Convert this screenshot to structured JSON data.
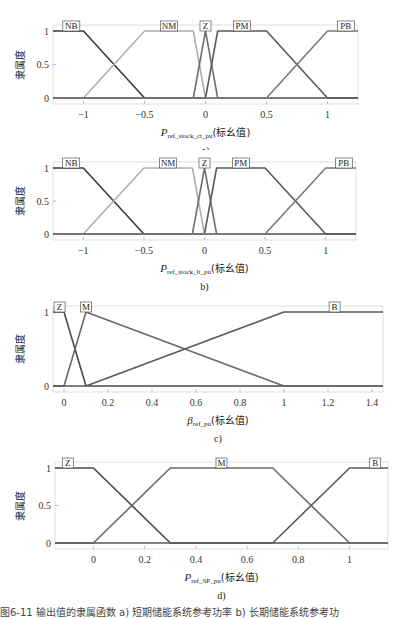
{
  "chart_data": [
    {
      "id": "a",
      "type": "line",
      "subtitle": "a)",
      "ylabel": "隶属度",
      "xlabel_var": "P",
      "xlabel_sub": "ref_stock_ct_pu",
      "xlabel_suffix": "(标幺值)",
      "xlim": [
        -1.25,
        1.25
      ],
      "ylim": [
        0,
        1
      ],
      "xticks": [
        -1,
        -0.5,
        0,
        0.5,
        1
      ],
      "xtick_labels": [
        "−1",
        "−0.5",
        "0",
        "0.5",
        "1"
      ],
      "yticks": [
        0,
        0.5,
        1
      ],
      "ytick_labels": [
        "0",
        "0.5",
        "1"
      ],
      "series": [
        {
          "name": "NB",
          "x": [
            -1.25,
            -1,
            -0.5,
            1.25
          ],
          "y": [
            1,
            1,
            0,
            0
          ],
          "color": "#3a3a3a"
        },
        {
          "name": "NM",
          "x": [
            -1.25,
            -1,
            -0.5,
            -0.1,
            0,
            1.25
          ],
          "y": [
            0,
            0,
            1,
            1,
            0,
            0
          ],
          "color": "#b0b0b0"
        },
        {
          "name": "Z",
          "x": [
            -1.25,
            -0.1,
            0,
            0.1,
            1.25
          ],
          "y": [
            0,
            0,
            1,
            0,
            0
          ],
          "color": "#6e6e6e"
        },
        {
          "name": "PM",
          "x": [
            -1.25,
            0,
            0.1,
            0.5,
            1,
            1.25
          ],
          "y": [
            0,
            0,
            1,
            1,
            0,
            0
          ],
          "color": "#5a5a5a"
        },
        {
          "name": "PB",
          "x": [
            -1.25,
            0.5,
            1,
            1.25
          ],
          "y": [
            0,
            0,
            1,
            1
          ],
          "color": "#7a7a7a"
        }
      ],
      "labels": [
        {
          "text": "NB",
          "x": -1.1
        },
        {
          "text": "NM",
          "x": -0.3
        },
        {
          "text": "Z",
          "x": 0
        },
        {
          "text": "PM",
          "x": 0.3
        },
        {
          "text": "PB",
          "x": 1.15
        }
      ]
    },
    {
      "id": "b",
      "type": "line",
      "subtitle": "b)",
      "ylabel": "隶属度",
      "xlabel_var": "P",
      "xlabel_sub": "ref_stock_lt_pu",
      "xlabel_suffix": "(标幺值)",
      "xlim": [
        -1.25,
        1.25
      ],
      "ylim": [
        0,
        1
      ],
      "xticks": [
        -1,
        -0.5,
        0,
        0.5,
        1
      ],
      "xtick_labels": [
        "−1",
        "−0.5",
        "0",
        "0.5",
        "1"
      ],
      "yticks": [
        0,
        0.5,
        1
      ],
      "ytick_labels": [
        "0",
        "0.5",
        "1"
      ],
      "series": [
        {
          "name": "NB",
          "x": [
            -1.25,
            -1,
            -0.5,
            1.25
          ],
          "y": [
            1,
            1,
            0,
            0
          ],
          "color": "#3a3a3a"
        },
        {
          "name": "NM",
          "x": [
            -1.25,
            -1,
            -0.5,
            -0.1,
            0,
            1.25
          ],
          "y": [
            0,
            0,
            1,
            1,
            0,
            0
          ],
          "color": "#b0b0b0"
        },
        {
          "name": "Z",
          "x": [
            -1.25,
            -0.1,
            0,
            0.1,
            1.25
          ],
          "y": [
            0,
            0,
            1,
            0,
            0
          ],
          "color": "#6e6e6e"
        },
        {
          "name": "PM",
          "x": [
            -1.25,
            0,
            0.1,
            0.5,
            1,
            1.25
          ],
          "y": [
            0,
            0,
            1,
            1,
            0,
            0
          ],
          "color": "#5a5a5a"
        },
        {
          "name": "PB",
          "x": [
            -1.25,
            0.5,
            1,
            1.25
          ],
          "y": [
            0,
            0,
            1,
            1
          ],
          "color": "#7a7a7a"
        }
      ],
      "labels": [
        {
          "text": "NB",
          "x": -1.1
        },
        {
          "text": "NM",
          "x": -0.3
        },
        {
          "text": "Z",
          "x": 0
        },
        {
          "text": "PM",
          "x": 0.3
        },
        {
          "text": "PB",
          "x": 1.15
        }
      ]
    },
    {
      "id": "c",
      "type": "line",
      "subtitle": "c)",
      "ylabel": "隶属度",
      "xlabel_var": "β",
      "xlabel_sub": "ref_pu",
      "xlabel_suffix": "(标幺值)",
      "xlim": [
        -0.05,
        1.45
      ],
      "ylim": [
        0,
        1
      ],
      "xticks": [
        0,
        0.2,
        0.4,
        0.6,
        0.8,
        1,
        1.2,
        1.4
      ],
      "xtick_labels": [
        "0",
        "0.2",
        "0.4",
        "0.6",
        "0.8",
        "1",
        "1.2",
        "1.4"
      ],
      "yticks": [
        0,
        1
      ],
      "ytick_labels": [
        "0",
        "1"
      ],
      "series": [
        {
          "name": "Z",
          "x": [
            -0.05,
            0,
            0.1,
            1.45
          ],
          "y": [
            1,
            1,
            0,
            0
          ],
          "color": "#4a4a4a"
        },
        {
          "name": "M",
          "x": [
            -0.05,
            0,
            0.1,
            1,
            1.45
          ],
          "y": [
            0,
            0,
            1,
            0,
            0
          ],
          "color": "#6a6a6a"
        },
        {
          "name": "B",
          "x": [
            -0.05,
            0.1,
            1,
            1.45
          ],
          "y": [
            0,
            0,
            1,
            1
          ],
          "color": "#5a5a5a"
        }
      ],
      "labels": [
        {
          "text": "Z",
          "x": -0.02
        },
        {
          "text": "M",
          "x": 0.1
        },
        {
          "text": "B",
          "x": 1.23
        }
      ]
    },
    {
      "id": "d",
      "type": "line",
      "subtitle": "d)",
      "ylabel": "隶属度",
      "xlabel_var": "P",
      "xlabel_sub": "ref_SP_pu",
      "xlabel_suffix": "(标幺值)",
      "xlim": [
        -0.15,
        1.15
      ],
      "ylim": [
        0,
        1
      ],
      "xticks": [
        0,
        0.2,
        0.4,
        0.6,
        0.8,
        1
      ],
      "xtick_labels": [
        "0",
        "0.2",
        "0.4",
        "0.6",
        "0.8",
        "1"
      ],
      "yticks": [
        0,
        0.5,
        1
      ],
      "ytick_labels": [
        "0",
        "0.5",
        "1"
      ],
      "series": [
        {
          "name": "Z",
          "x": [
            -0.15,
            0,
            0.3,
            1.15
          ],
          "y": [
            1,
            1,
            0,
            0
          ],
          "color": "#4a4a4a"
        },
        {
          "name": "M",
          "x": [
            -0.15,
            0,
            0.3,
            0.7,
            1,
            1.15
          ],
          "y": [
            0,
            0,
            1,
            1,
            0,
            0
          ],
          "color": "#6a6a6a"
        },
        {
          "name": "B",
          "x": [
            -0.15,
            0.7,
            1,
            1.15
          ],
          "y": [
            0,
            0,
            1,
            1
          ],
          "color": "#5a5a5a"
        }
      ],
      "labels": [
        {
          "text": "Z",
          "x": -0.1
        },
        {
          "text": "M",
          "x": 0.5
        },
        {
          "text": "B",
          "x": 1.1
        }
      ]
    }
  ],
  "layout": [
    {
      "top": 0,
      "height": 150,
      "plot": {
        "left": 53,
        "right": 358,
        "y1": 31,
        "y0": 98
      }
    },
    {
      "top": 150,
      "height": 150,
      "plot": {
        "left": 53,
        "right": 356,
        "y1": 18,
        "y0": 84
      }
    },
    {
      "top": 300,
      "height": 150,
      "plot": {
        "left": 53,
        "right": 383,
        "y1": 12,
        "y0": 86
      }
    },
    {
      "top": 450,
      "height": 152,
      "plot": {
        "left": 55,
        "right": 388,
        "y1": 18,
        "y0": 93
      }
    }
  ],
  "caption": "图6-11  输出值的隶属函数   a) 短期储能系统参考功率   b) 长期储能系统参考功"
}
